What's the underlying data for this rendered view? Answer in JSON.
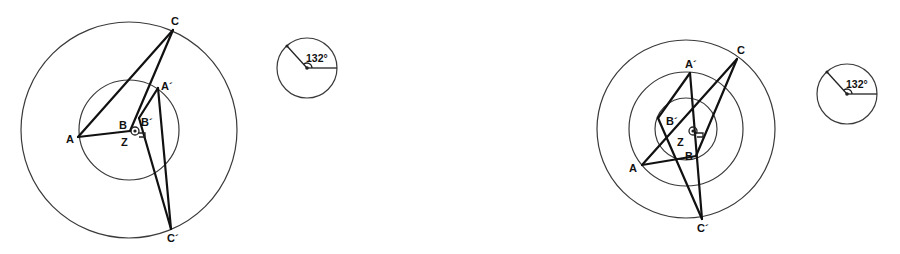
{
  "figures": [
    {
      "id": "left",
      "circles": [
        {
          "cx": 129,
          "cy": 130,
          "r": 108
        },
        {
          "cx": 129,
          "cy": 130,
          "r": 50
        }
      ],
      "points": {
        "A": {
          "x": 78,
          "y": 137,
          "label": "A",
          "lx": 66,
          "ly": 143
        },
        "B": {
          "x": 130,
          "y": 131,
          "label": "B",
          "lx": 119,
          "ly": 129
        },
        "C": {
          "x": 173,
          "y": 30,
          "label": "C",
          "lx": 171,
          "ly": 25
        },
        "A'": {
          "x": 158,
          "y": 88,
          "label": "A´",
          "lx": 161,
          "ly": 90
        },
        "B'": {
          "x": 139,
          "y": 118,
          "label": "B´",
          "lx": 141,
          "ly": 126
        },
        "C'": {
          "x": 171,
          "y": 229,
          "label": "C´",
          "lx": 167,
          "ly": 242
        },
        "Z": {
          "x": 130,
          "y": 131,
          "label": "Z",
          "lx": 121,
          "ly": 146
        }
      },
      "segments": [
        [
          "A",
          "B"
        ],
        [
          "B",
          "C"
        ],
        [
          "C",
          "A"
        ],
        [
          "A'",
          "B'"
        ],
        [
          "B'",
          "C'"
        ],
        [
          "C'",
          "A'"
        ]
      ]
    },
    {
      "id": "right",
      "circles": [
        {
          "cx": 686,
          "cy": 129,
          "r": 89
        },
        {
          "cx": 686,
          "cy": 129,
          "r": 57
        },
        {
          "cx": 686,
          "cy": 129,
          "r": 31
        }
      ],
      "points": {
        "A": {
          "x": 642,
          "y": 165,
          "label": "A",
          "lx": 629,
          "ly": 172
        },
        "B": {
          "x": 696,
          "y": 156,
          "label": "B",
          "lx": 685,
          "ly": 160
        },
        "C": {
          "x": 737,
          "y": 59,
          "label": "C",
          "lx": 737,
          "ly": 54
        },
        "A'": {
          "x": 690,
          "y": 73,
          "label": "A´",
          "lx": 685,
          "ly": 68
        },
        "B'": {
          "x": 658,
          "y": 118,
          "label": "B´",
          "lx": 666,
          "ly": 125
        },
        "C'": {
          "x": 702,
          "y": 219,
          "label": "C´",
          "lx": 697,
          "ly": 232
        },
        "Z": {
          "x": 686,
          "y": 129,
          "label": "Z",
          "lx": 677,
          "ly": 146
        }
      },
      "segments": [
        [
          "A",
          "B"
        ],
        [
          "B",
          "C"
        ],
        [
          "C",
          "A"
        ],
        [
          "A'",
          "B'"
        ],
        [
          "B'",
          "C'"
        ],
        [
          "C'",
          "A'"
        ]
      ]
    }
  ],
  "angle_indicators": [
    {
      "cx": 307,
      "cy": 68,
      "r": 30,
      "arm_x": 287,
      "arm_y": 46,
      "label": "132°",
      "lx": 306,
      "ly": 62
    },
    {
      "cx": 847,
      "cy": 94,
      "r": 30,
      "arm_x": 827,
      "arm_y": 72,
      "label": "132°",
      "lx": 846,
      "ly": 88
    }
  ],
  "rotation_centers": [
    {
      "cx": 135,
      "cy": 131
    },
    {
      "cx": 693,
      "cy": 131
    }
  ]
}
